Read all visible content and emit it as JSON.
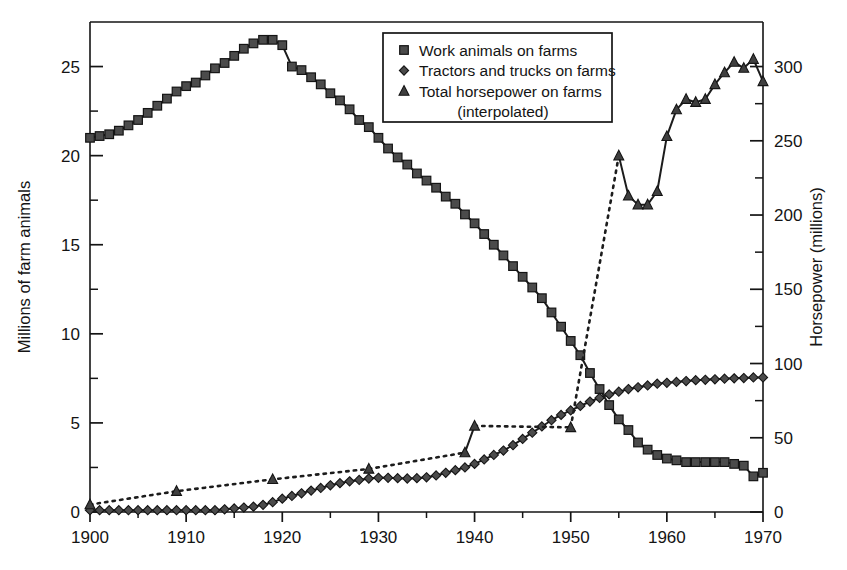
{
  "chart_data": {
    "type": "line",
    "title": "",
    "xlabel": "",
    "ylabel": "Millions of farm animals",
    "y2label": "Horsepower  (millions)",
    "xlim": [
      1900,
      1970
    ],
    "ylim": [
      0,
      27.5
    ],
    "y2lim": [
      0,
      330
    ],
    "grid": false,
    "legend_position": "top-center",
    "x_ticks": [
      1900,
      1910,
      1920,
      1930,
      1940,
      1950,
      1960,
      1970
    ],
    "x_tick_labels": [
      "1900",
      "1910",
      "1920",
      "1930",
      "1940",
      "1950",
      "1960",
      "1970"
    ],
    "x_minor_ticks": [
      1905,
      1915,
      1925,
      1935,
      1945,
      1955,
      1965
    ],
    "y_ticks": [
      0,
      5,
      10,
      15,
      20,
      25
    ],
    "y_tick_labels": [
      "0",
      "5",
      "10",
      "15",
      "20",
      "25"
    ],
    "y_minor_ticks": [
      2.5,
      7.5,
      12.5,
      17.5,
      22.5
    ],
    "y2_ticks": [
      0,
      50,
      100,
      150,
      200,
      250,
      300
    ],
    "y2_tick_labels": [
      "0",
      "50",
      "100",
      "150",
      "200",
      "250",
      "300"
    ],
    "y2_minor_ticks": [
      25,
      75,
      125,
      175,
      225,
      275
    ],
    "series": [
      {
        "name": "Work animals on farms",
        "marker": "square",
        "linestyle": "solid",
        "axis": "left",
        "units": "millions of animals",
        "x": [
          1900,
          1901,
          1902,
          1903,
          1904,
          1905,
          1906,
          1907,
          1908,
          1909,
          1910,
          1911,
          1912,
          1913,
          1914,
          1915,
          1916,
          1917,
          1918,
          1919,
          1920,
          1921,
          1922,
          1923,
          1924,
          1925,
          1926,
          1927,
          1928,
          1929,
          1930,
          1931,
          1932,
          1933,
          1934,
          1935,
          1936,
          1937,
          1938,
          1939,
          1940,
          1941,
          1942,
          1943,
          1944,
          1945,
          1946,
          1947,
          1948,
          1949,
          1950,
          1951,
          1952,
          1953,
          1954,
          1955,
          1956,
          1957,
          1958,
          1959,
          1960,
          1961,
          1962,
          1963,
          1964,
          1965,
          1966,
          1967,
          1968,
          1969,
          1970
        ],
        "y": [
          21.0,
          21.1,
          21.2,
          21.4,
          21.7,
          22.0,
          22.4,
          22.8,
          23.2,
          23.6,
          23.9,
          24.1,
          24.5,
          24.9,
          25.2,
          25.6,
          26.0,
          26.3,
          26.5,
          26.5,
          26.2,
          25.0,
          24.8,
          24.4,
          24.0,
          23.5,
          23.1,
          22.6,
          22.0,
          21.6,
          21.0,
          20.4,
          19.9,
          19.5,
          19.0,
          18.6,
          18.2,
          17.7,
          17.3,
          16.7,
          16.2,
          15.6,
          15.0,
          14.4,
          13.8,
          13.2,
          12.6,
          12.0,
          11.2,
          10.4,
          9.6,
          8.8,
          7.8,
          6.9,
          6.0,
          5.2,
          4.6,
          3.9,
          3.5,
          3.2,
          3.0,
          2.9,
          2.8,
          2.8,
          2.8,
          2.8,
          2.8,
          2.7,
          2.6,
          2.0,
          2.2
        ]
      },
      {
        "name": "Tractors and trucks on farms",
        "marker": "diamond",
        "linestyle": "solid",
        "axis": "left",
        "units": "millions of units",
        "x": [
          1900,
          1901,
          1902,
          1903,
          1904,
          1905,
          1906,
          1907,
          1908,
          1909,
          1910,
          1911,
          1912,
          1913,
          1914,
          1915,
          1916,
          1917,
          1918,
          1919,
          1920,
          1921,
          1922,
          1923,
          1924,
          1925,
          1926,
          1927,
          1928,
          1929,
          1930,
          1931,
          1932,
          1933,
          1934,
          1935,
          1936,
          1937,
          1938,
          1939,
          1940,
          1941,
          1942,
          1943,
          1944,
          1945,
          1946,
          1947,
          1948,
          1949,
          1950,
          1951,
          1952,
          1953,
          1954,
          1955,
          1956,
          1957,
          1958,
          1959,
          1960,
          1961,
          1962,
          1963,
          1964,
          1965,
          1966,
          1967,
          1968,
          1969,
          1970
        ],
        "y": [
          0.1,
          0.1,
          0.1,
          0.1,
          0.1,
          0.1,
          0.1,
          0.1,
          0.1,
          0.1,
          0.1,
          0.1,
          0.1,
          0.1,
          0.15,
          0.2,
          0.25,
          0.3,
          0.4,
          0.55,
          0.75,
          0.9,
          1.05,
          1.2,
          1.35,
          1.5,
          1.62,
          1.72,
          1.8,
          1.88,
          1.92,
          1.92,
          1.9,
          1.88,
          1.9,
          1.95,
          2.05,
          2.2,
          2.35,
          2.5,
          2.7,
          2.95,
          3.2,
          3.45,
          3.75,
          4.1,
          4.45,
          4.8,
          5.15,
          5.45,
          5.7,
          5.95,
          6.2,
          6.4,
          6.6,
          6.75,
          6.9,
          7.0,
          7.1,
          7.2,
          7.25,
          7.3,
          7.35,
          7.4,
          7.42,
          7.45,
          7.48,
          7.5,
          7.52,
          7.55,
          7.55
        ]
      },
      {
        "name": "Total horsepower on farms (interpolated)",
        "marker": "triangle",
        "linestyle": "dotted",
        "axis": "right",
        "units": "millions of horsepower",
        "segments": [
          {
            "style": "dotted",
            "x": [
              1900,
              1909,
              1919,
              1929,
              1939
            ],
            "y": [
              5,
              14,
              22,
              29,
              40
            ]
          },
          {
            "style": "solid",
            "x": [
              1939,
              1940
            ],
            "y": [
              40,
              58
            ]
          },
          {
            "style": "dotted",
            "x": [
              1940,
              1950
            ],
            "y": [
              58,
              57
            ]
          },
          {
            "style": "dotted",
            "x": [
              1950,
              1955
            ],
            "y": [
              57,
              240
            ]
          },
          {
            "style": "solid",
            "x": [
              1955,
              1956,
              1957,
              1958,
              1959,
              1960,
              1961,
              1962,
              1963,
              1964,
              1965,
              1966,
              1967,
              1968,
              1969,
              1970
            ],
            "y": [
              240,
              213,
              207,
              207,
              216,
              253,
              271,
              278,
              276,
              278,
              288,
              296,
              303,
              299,
              305,
              290
            ]
          }
        ]
      }
    ],
    "annotations": []
  },
  "legend": {
    "entries": [
      {
        "marker": "square",
        "label": "Work animals on farms"
      },
      {
        "marker": "diamond",
        "label": "Tractors and trucks on farms"
      },
      {
        "marker": "triangle",
        "label": "Total horsepower on farms"
      }
    ],
    "sub_label": "(interpolated)"
  },
  "axes": {
    "left_title": "Millions of farm animals",
    "right_title": "Horsepower  (millions)"
  }
}
